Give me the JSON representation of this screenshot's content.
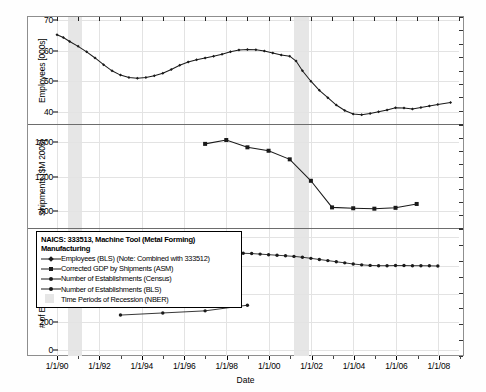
{
  "chart_data": {
    "type": "line",
    "title": "NAICS: 333513, Machine Tool (Metal Forming) Manufacturing",
    "xlabel": "Date",
    "x_tick_labels": [
      "1/1/90",
      "1/1/92",
      "1/1/94",
      "1/1/96",
      "1/1/98",
      "1/1/00",
      "1/1/02",
      "1/1/04",
      "1/1/06",
      "1/1/08"
    ],
    "xlim": [
      1990,
      2009
    ],
    "grid": true,
    "legend_position": "lower-left-inset",
    "panels": [
      {
        "name": "employees",
        "ylabel": "Employees [000s]",
        "y_tick_labels": [
          "40",
          "50",
          "60",
          "70"
        ],
        "y_ticks": [
          40,
          50,
          60,
          70
        ],
        "ylim": [
          36,
          71
        ],
        "series": [
          {
            "name": "Employees (BLS) (Note: Combined with 333512)",
            "marker": "diamond",
            "x": [
              1990.0,
              1990.3,
              1990.6,
              1991.0,
              1991.4,
              1991.8,
              1992.2,
              1992.6,
              1993.0,
              1993.4,
              1993.8,
              1994.2,
              1994.6,
              1995.0,
              1995.4,
              1995.8,
              1996.2,
              1996.6,
              1997.0,
              1997.4,
              1997.8,
              1998.2,
              1998.6,
              1999.0,
              1999.4,
              1999.8,
              2000.2,
              2000.6,
              2001.0,
              2001.3,
              2001.6,
              2002.0,
              2002.4,
              2002.8,
              2003.2,
              2003.6,
              2004.0,
              2004.4,
              2004.8,
              2005.2,
              2005.6,
              2006.0,
              2006.4,
              2006.8,
              2007.2,
              2007.6,
              2008.0,
              2008.6
            ],
            "y": [
              65.2,
              64.3,
              63.0,
              61.4,
              59.6,
              57.6,
              55.4,
              53.4,
              52.0,
              51.2,
              51.0,
              51.2,
              51.8,
              52.6,
              53.8,
              55.2,
              56.3,
              57.0,
              57.6,
              58.2,
              58.8,
              59.6,
              60.2,
              60.4,
              60.3,
              59.9,
              59.2,
              58.6,
              58.2,
              56.6,
              53.4,
              50.0,
              47.0,
              44.6,
              42.2,
              40.4,
              39.3,
              39.0,
              39.4,
              40.0,
              40.6,
              41.3,
              41.2,
              40.9,
              41.4,
              41.9,
              42.4,
              43.0
            ]
          }
        ]
      },
      {
        "name": "shipments",
        "ylabel": "Shipments [$M 2005]",
        "y_tick_labels": [
          "800",
          "1200",
          "1600"
        ],
        "y_ticks": [
          800,
          1200,
          1600
        ],
        "ylim": [
          600,
          1800
        ],
        "series": [
          {
            "name": "Corrected GDP by Shipments (ASM)",
            "marker": "square",
            "x": [
              1997,
              1998,
              1999,
              2000,
              2001,
              2002,
              2003,
              2004,
              2005,
              2006,
              2007
            ],
            "y": [
              1580,
              1625,
              1540,
              1500,
              1400,
              1150,
              840,
              830,
              825,
              835,
              880
            ]
          }
        ]
      },
      {
        "name": "establishments",
        "ylabel": "# of Establishments",
        "y_tick_labels": [
          "0",
          "200",
          "400",
          "600",
          "800"
        ],
        "y_ticks": [
          0,
          200,
          400,
          600,
          800
        ],
        "ylim": [
          -40,
          860
        ],
        "series": [
          {
            "name": "Number of Establishments (Census)",
            "marker": "dot",
            "x": [
              1993,
              1995,
              1997,
              1999
            ],
            "y": [
              250,
              265,
              280,
              320
            ]
          },
          {
            "name": "Number of Establishments (BLS)",
            "marker": "dot",
            "x": [
              1994.0,
              1994.4,
              1994.8,
              1995.2,
              1995.6,
              1996.0,
              1996.4,
              1996.8,
              1997.2,
              1997.6,
              1998.0,
              1998.4,
              1998.8,
              1999.2,
              1999.6,
              2000.0,
              2000.4,
              2000.8,
              2001.2,
              2001.6,
              2002.0,
              2002.4,
              2002.8,
              2003.2,
              2003.6,
              2004.0,
              2004.4,
              2004.8,
              2005.2,
              2005.6,
              2006.0,
              2006.4,
              2006.8,
              2007.2,
              2007.6,
              2008.0
            ],
            "y": [
              712,
              718,
              716,
              714,
              710,
              706,
              702,
              700,
              698,
              694,
              692,
              690,
              688,
              686,
              682,
              678,
              674,
              670,
              666,
              660,
              652,
              644,
              636,
              628,
              620,
              612,
              606,
              602,
              600,
              600,
              601,
              601,
              600,
              600,
              599,
              598
            ]
          }
        ]
      }
    ],
    "recessions": [
      {
        "label": "Jul 1990 - Mar 1991",
        "start": 1990.5,
        "end": 1991.2
      },
      {
        "label": "Mar 2001 - Nov 2001",
        "start": 2001.2,
        "end": 2001.9
      }
    ]
  },
  "legend": {
    "title_line1": "NAICS: 333513, Machine Tool (Metal Forming)",
    "title_line2": "Manufacturing",
    "entries": [
      {
        "label": "Employees (BLS) (Note: Combined with 333512)",
        "marker": "diamond",
        "color": "#1a1a1a"
      },
      {
        "label": "Corrected GDP by Shipments (ASM)",
        "marker": "square",
        "color": "#1a1a1a"
      },
      {
        "label": "Number of Establishments (Census)",
        "marker": "dot",
        "color": "#1a1a1a"
      },
      {
        "label": "Number of Establishments (BLS)",
        "marker": "dot",
        "color": "#1a1a1a"
      },
      {
        "label": "Time Periods of Recession (NBER)",
        "marker": "swatch",
        "color": "#e6e6e6"
      }
    ]
  },
  "colors": {
    "series": "#1a1a1a",
    "recession_band": "#e6e6e6",
    "grid": "#e3e3e3",
    "frame": "#8e8e8e"
  }
}
